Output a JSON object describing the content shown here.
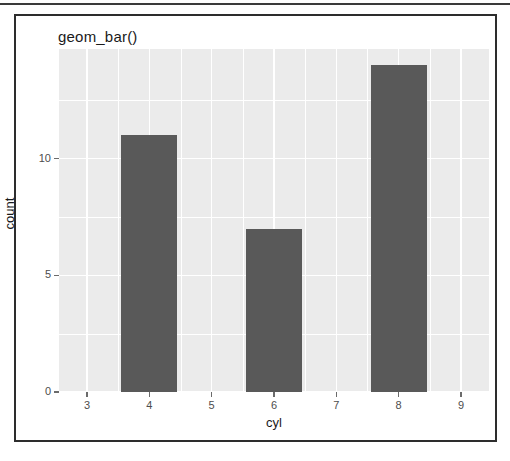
{
  "figure": {
    "title": "geom_bar()"
  },
  "chart_data": {
    "type": "bar",
    "title": "geom_bar()",
    "xlabel": "cyl",
    "ylabel": "count",
    "categories": [
      "4",
      "6",
      "8"
    ],
    "values": [
      11,
      7,
      14
    ],
    "x": [
      4,
      6,
      8
    ],
    "bar_width": 0.9,
    "xlim": [
      2.55,
      9.45
    ],
    "ylim": [
      0,
      14.7
    ],
    "x_ticks": [
      3,
      4,
      5,
      6,
      7,
      8,
      9
    ],
    "x_tick_labels": [
      "3",
      "4",
      "5",
      "6",
      "7",
      "8",
      "9"
    ],
    "y_ticks": [
      0,
      5,
      10
    ],
    "y_tick_labels": [
      "0",
      "5",
      "10"
    ],
    "grid": true,
    "legend": "none",
    "colors": {
      "bar_fill": "#595959",
      "panel_background": "#ebebeb",
      "gridline": "#ffffff",
      "axis_text": "#4d4d4d",
      "frame": "#2d2d2d"
    }
  }
}
